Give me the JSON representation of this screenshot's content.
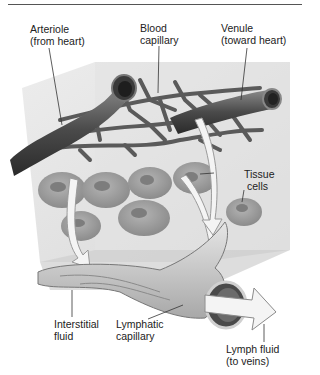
{
  "diagram": {
    "labels": {
      "arteriole": {
        "line1": "Arteriole",
        "line2": "(from heart)"
      },
      "blood_capillary": {
        "line1": "Blood",
        "line2": "capillary"
      },
      "venule": {
        "line1": "Venule",
        "line2": "(toward heart)"
      },
      "tissue_cells": {
        "line1": "Tissue",
        "line2": "cells"
      },
      "interstitial_fluid": {
        "line1": "Interstitial",
        "line2": "fluid"
      },
      "lymphatic_capillary": {
        "line1": "Lymphatic",
        "line2": "capillary"
      },
      "lymph_fluid": {
        "line1": "Lymph fluid",
        "line2": "(to veins)"
      }
    },
    "colors": {
      "vessel_dark": "#3a3a3a",
      "vessel_mid": "#6e6e6e",
      "cell_fill": "#9a9a9a",
      "cell_nucleus": "#7d7d7d",
      "tissue_block": "#dcdcdc",
      "arrow_fill": "#f4f4f4"
    }
  }
}
